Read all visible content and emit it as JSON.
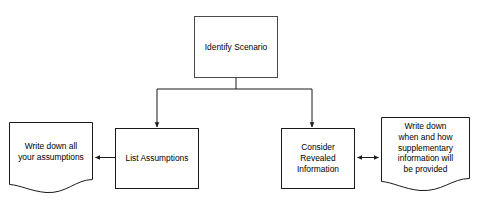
{
  "diagram": {
    "background_color": "#ffffff",
    "stroke_color": "#1a1a1a",
    "text_color": "#000000",
    "nodes": [
      {
        "id": "identify-scenario",
        "shape": "rectangle",
        "label": "Identify Scenario",
        "x": 194,
        "y": 16,
        "width": 84,
        "height": 62
      },
      {
        "id": "list-assumptions",
        "shape": "rectangle",
        "label": "List Assumptions",
        "x": 115,
        "y": 128,
        "width": 84,
        "height": 61
      },
      {
        "id": "consider-revealed-information",
        "shape": "rectangle",
        "label": "Consider\nRevealed\nInformation",
        "x": 281,
        "y": 128,
        "width": 74,
        "height": 61
      },
      {
        "id": "write-down-assumptions",
        "shape": "document",
        "label": "Write down all\nyour assumptions",
        "x": 9,
        "y": 122,
        "width": 84,
        "height": 64
      },
      {
        "id": "write-down-supplementary",
        "shape": "document",
        "label": "Write down\nwhen and how\nsupplementary\ninformation will\nbe provided",
        "x": 381,
        "y": 117,
        "width": 89,
        "height": 68
      }
    ],
    "connectors": [
      {
        "id": "identify-to-list",
        "from": "identify-scenario",
        "to": "list-assumptions",
        "arrow": "single",
        "direction": "down"
      },
      {
        "id": "identify-to-consider",
        "from": "identify-scenario",
        "to": "consider-revealed-information",
        "arrow": "single",
        "direction": "down"
      },
      {
        "id": "list-to-writedown",
        "from": "list-assumptions",
        "to": "write-down-assumptions",
        "arrow": "single",
        "direction": "left"
      },
      {
        "id": "consider-to-supplementary",
        "from": "consider-revealed-information",
        "to": "write-down-supplementary",
        "arrow": "double",
        "direction": "horizontal"
      }
    ]
  }
}
